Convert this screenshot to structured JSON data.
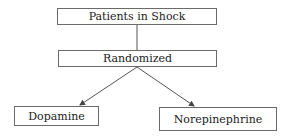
{
  "diagram": {
    "type": "flowchart",
    "nodes": [
      {
        "id": "shock",
        "label": "Patients in Shock"
      },
      {
        "id": "randomized",
        "label": "Randomized"
      },
      {
        "id": "dopamine",
        "label": "Dopamine"
      },
      {
        "id": "norepinephrine",
        "label": "Norepinephrine"
      }
    ],
    "edges": [
      {
        "from": "shock",
        "to": "randomized",
        "style": "line"
      },
      {
        "from": "randomized",
        "to": "dopamine",
        "style": "arrow"
      },
      {
        "from": "randomized",
        "to": "norepinephrine",
        "style": "arrow"
      }
    ],
    "colors": {
      "border": "#6a6a6a",
      "line": "#555555",
      "text": "#222222"
    }
  }
}
